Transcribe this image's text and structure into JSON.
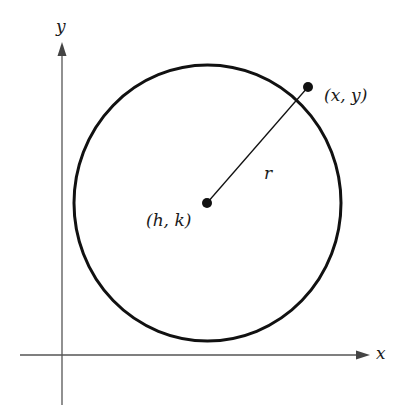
{
  "diagram": {
    "axes": {
      "x_label": "x",
      "y_label": "y"
    },
    "center_label": "(h, k)",
    "point_label": "(x, y)",
    "radius_label": "r",
    "colors": {
      "stroke": "#111111",
      "axis": "#555555",
      "background": "#ffffff"
    }
  }
}
